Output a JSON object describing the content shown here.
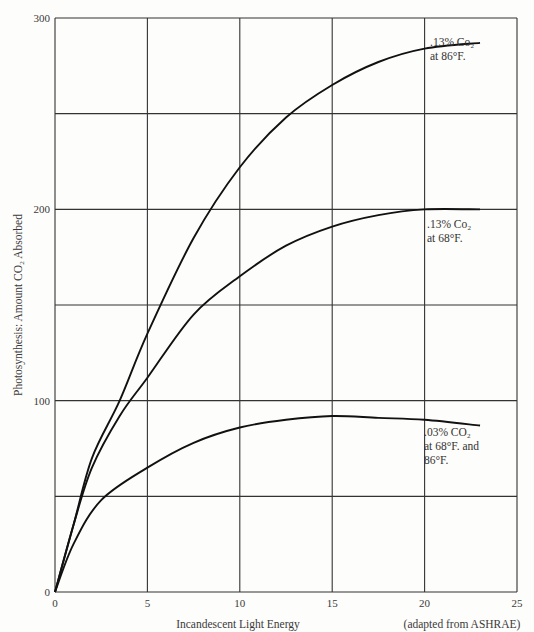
{
  "chart_data": {
    "type": "line",
    "title": "",
    "xlabel": "Incandescent Light Energy",
    "ylabel": "Photosynthesis: Amount CO₂ Absorbed",
    "source_note": "(adapted from ASHRAE)",
    "xlim": [
      0,
      25
    ],
    "ylim": [
      0,
      300
    ],
    "x_ticks": [
      0,
      5,
      10,
      15,
      20,
      25
    ],
    "y_ticks": [
      0,
      100,
      200,
      300
    ],
    "y_grid": [
      50,
      100,
      150,
      200,
      250,
      300
    ],
    "grid": true,
    "legend": "inline annotations at right end of curves",
    "series": [
      {
        "name": ".13% CO₂ at 86°F.",
        "label_lines": [
          ".13% Co₂",
          "at 86°F."
        ],
        "x": [
          0,
          1,
          2,
          3.5,
          5,
          7.5,
          10,
          12.5,
          15,
          17.5,
          20,
          23
        ],
        "y": [
          0,
          35,
          70,
          100,
          135,
          185,
          222,
          248,
          265,
          277,
          284,
          287
        ]
      },
      {
        "name": ".13% CO₂ at 68°F.",
        "label_lines": [
          ".13% Co₂",
          "at 68°F."
        ],
        "x": [
          0,
          1,
          2,
          3.5,
          5,
          7.5,
          10,
          12.5,
          15,
          17.5,
          20,
          23
        ],
        "y": [
          0,
          35,
          65,
          92,
          112,
          145,
          165,
          181,
          191,
          197,
          200,
          200
        ]
      },
      {
        "name": ".03% CO₂ at 68°F. and 86°F.",
        "label_lines": [
          ".03% CO₂",
          "at 68°F. and",
          "86°F."
        ],
        "x": [
          0,
          1,
          2.5,
          5,
          7.5,
          10,
          12.5,
          15,
          17.5,
          20,
          23
        ],
        "y": [
          0,
          25,
          48,
          65,
          78,
          86,
          90,
          92,
          91,
          90,
          87
        ]
      }
    ]
  }
}
